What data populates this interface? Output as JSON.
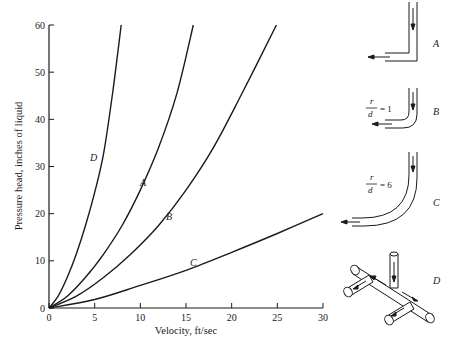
{
  "chart_data": {
    "type": "line",
    "title": "",
    "xlabel": "Velocity, ft/sec",
    "ylabel": "Pressure head, inches of liquid",
    "xlim": [
      0,
      30
    ],
    "ylim": [
      0,
      60
    ],
    "xticks": [
      0,
      5,
      10,
      15,
      20,
      25,
      30
    ],
    "yticks": [
      0,
      10,
      20,
      30,
      40,
      50,
      60
    ],
    "grid": false,
    "legend": "inline curve labels",
    "series": [
      {
        "name": "D",
        "x": [
          0,
          1,
          2,
          3,
          4,
          5,
          6,
          7,
          7.9
        ],
        "y": [
          0,
          2.5,
          6.5,
          11.5,
          17.5,
          24.5,
          33,
          46,
          60
        ]
      },
      {
        "name": "A",
        "x": [
          0,
          2,
          4,
          6,
          8,
          10,
          12,
          14,
          15.8
        ],
        "y": [
          0,
          2.5,
          6.5,
          11.5,
          17.5,
          25,
          34,
          45.5,
          60
        ]
      },
      {
        "name": "B",
        "x": [
          0,
          3,
          6,
          9,
          12,
          15,
          18,
          21,
          24.9
        ],
        "y": [
          0,
          2.5,
          6.5,
          11.5,
          17.5,
          25,
          34,
          45,
          60
        ]
      },
      {
        "name": "C",
        "x": [
          0,
          5,
          10,
          15,
          20,
          25,
          30
        ],
        "y": [
          0,
          1.8,
          4.8,
          8,
          11.8,
          15.8,
          20
        ]
      }
    ],
    "annotations": [
      {
        "text": "D",
        "x": 3.5,
        "y": 32
      },
      {
        "text": "A",
        "x": 9,
        "y": 21
      },
      {
        "text": "B",
        "x": 14.5,
        "y": 13.5
      },
      {
        "text": "C",
        "x": 17,
        "y": 6.5
      }
    ],
    "diagrams": [
      {
        "label": "A",
        "description": "sharp 90-degree elbow"
      },
      {
        "label": "B",
        "ratio_text": "r/d = 1",
        "description": "short-radius bend"
      },
      {
        "label": "C",
        "ratio_text": "r/d = 6",
        "description": "long-radius bend"
      },
      {
        "label": "D",
        "description": "tee branch, flow entering vertically and splitting"
      }
    ]
  },
  "labels": {
    "xlabel": "Velocity, ft/sec",
    "ylabel": "Pressure head, inches of liquid",
    "curveD": "D",
    "curveA": "A",
    "curveB": "B",
    "curveC": "C",
    "diagA": "A",
    "diagB": "B",
    "diagC": "C",
    "diagD": "D",
    "r": "r",
    "d": "d",
    "eq1": "= 1",
    "eq6": "= 6"
  },
  "ticks": {
    "x": [
      "0",
      "5",
      "10",
      "15",
      "20",
      "25",
      "30"
    ],
    "y": [
      "0",
      "10",
      "20",
      "30",
      "40",
      "50",
      "60"
    ]
  }
}
